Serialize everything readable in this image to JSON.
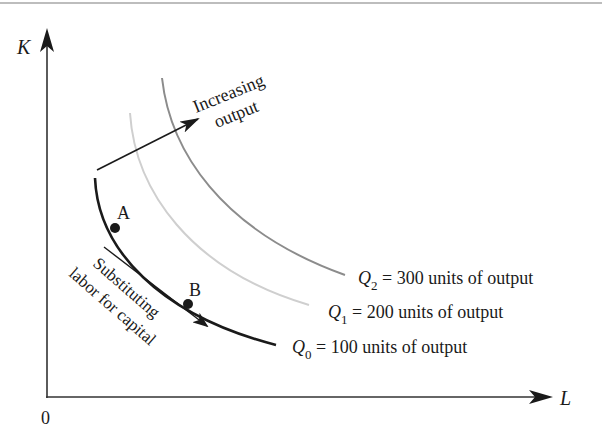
{
  "diagram": {
    "type": "isoquant-map",
    "axes": {
      "y_label": "K",
      "x_label": "L",
      "origin_label": "0"
    },
    "curves": [
      {
        "id": "Q0",
        "symbol": "Q",
        "subscript": "0",
        "text": " = 100 units of output",
        "output": 100,
        "color": "#1a1a1a"
      },
      {
        "id": "Q1",
        "symbol": "Q",
        "subscript": "1",
        "text": " = 200 units of output",
        "output": 200,
        "color": "#c8c8c8"
      },
      {
        "id": "Q2",
        "symbol": "Q",
        "subscript": "2",
        "text": " = 300 units of output",
        "output": 300,
        "color": "#8c8c8c"
      }
    ],
    "points": [
      {
        "label": "A",
        "curve": "Q0"
      },
      {
        "label": "B",
        "curve": "Q0"
      }
    ],
    "annotations": {
      "increasing_line1": "Increasing",
      "increasing_line2": "output",
      "substituting_line1": "Substituting",
      "substituting_line2": "labor for capital"
    }
  }
}
